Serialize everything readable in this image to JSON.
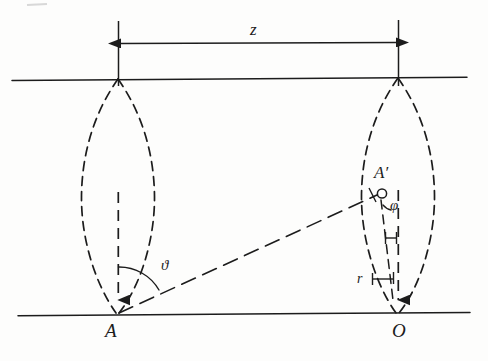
{
  "figure": {
    "ink_color": "#1c1c1c",
    "background_color": "#fdfdfc"
  },
  "labels": {
    "distance_z": "z",
    "point_A": "A",
    "point_O": "O",
    "point_A_prime": "A′",
    "angle_phi": "φ",
    "angle_theta": "ϑ",
    "radius_r": "r"
  },
  "geometry": {
    "left_axis_x": 118,
    "right_axis_x": 398,
    "top_line_y": 79,
    "bottom_line_y": 315,
    "dimension_line_y": 43,
    "lens_half_width": 37,
    "a_prime_x": 378,
    "a_prime_y": 194
  },
  "elements": {
    "upper_baseline": "upper horizontal baseline",
    "lower_baseline": "lower horizontal baseline",
    "dimension_arrow": "double headed arrow spanning z",
    "left_lobe": "dashed lens shape at A",
    "right_lobe": "dashed lens shape at O",
    "sight_line": "dashed line from A to A-prime",
    "left_axis_dashed": "dashed vertical axis inside left lobe",
    "right_axis_dashed": "dashed vertical axis inside right lobe"
  }
}
